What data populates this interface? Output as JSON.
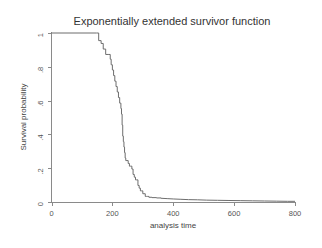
{
  "chart_data": {
    "type": "line",
    "title": "Exponentially extended survivor function",
    "xlabel": "analysis time",
    "ylabel": "Survival probability",
    "xlim": [
      0,
      800
    ],
    "ylim": [
      0,
      1
    ],
    "grid": false,
    "legend": null,
    "x_ticks": [
      0,
      200,
      400,
      600,
      800
    ],
    "x_tick_labels": [
      "0",
      "200",
      "400",
      "600",
      "800"
    ],
    "y_ticks": [
      0,
      0.2,
      0.4,
      0.6,
      0.8,
      1
    ],
    "y_tick_labels": [
      "0",
      ".2",
      ".4",
      ".6",
      ".8",
      "1"
    ],
    "line_color": "#6d6d6d",
    "axis_color": "#8a8a8a",
    "background_color": "#ffffff",
    "series": [
      {
        "name": "Survivor function",
        "step": "post",
        "description": "Kaplan-Meier step function flat at 1 until t=155, falling steeply between t=155 and t=320, then an exponentially extended smooth tail decaying toward 0 out to t=800",
        "x": [
          0,
          148,
          155,
          163,
          170,
          178,
          186,
          193,
          196,
          200,
          204,
          208,
          212,
          216,
          220,
          224,
          228,
          230,
          232,
          234,
          236,
          238,
          240,
          242,
          244,
          248,
          252,
          256,
          260,
          264,
          268,
          272,
          276,
          280,
          284,
          288,
          292,
          296,
          300,
          304,
          308,
          312,
          316,
          320,
          330,
          345,
          360,
          380,
          400,
          425,
          450,
          480,
          510,
          545,
          580,
          620,
          660,
          700,
          740,
          775,
          800
        ],
        "y": [
          1,
          1,
          0.955,
          0.938,
          0.905,
          0.873,
          0.873,
          0.845,
          0.812,
          0.781,
          0.748,
          0.715,
          0.683,
          0.651,
          0.618,
          0.585,
          0.553,
          0.52,
          0.455,
          0.39,
          0.357,
          0.325,
          0.292,
          0.26,
          0.245,
          0.245,
          0.228,
          0.212,
          0.212,
          0.195,
          0.163,
          0.147,
          0.131,
          0.131,
          0.098,
          0.082,
          0.066,
          0.066,
          0.049,
          0.049,
          0.033,
          0.033,
          0.033,
          0.028,
          0.026,
          0.024,
          0.022,
          0.02,
          0.018,
          0.016,
          0.014,
          0.013,
          0.011,
          0.01,
          0.009,
          0.008,
          0.007,
          0.006,
          0.005,
          0.004,
          0.004
        ]
      }
    ]
  }
}
